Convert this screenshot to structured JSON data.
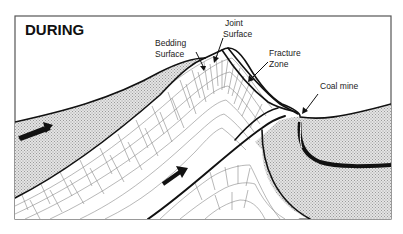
{
  "diagram": {
    "title": "DURING",
    "labels": {
      "bedding_surface_line1": "Bedding",
      "bedding_surface_line2": "Surface",
      "joint_surface_line1": "Joint",
      "joint_surface_line2": "Surface",
      "fracture_zone_line1": "Fracture",
      "fracture_zone_line2": "Zone",
      "coal_mine": "Coal mine"
    },
    "colors": {
      "frame": "#555555",
      "stroke": "#111111",
      "shaded_fill": "#d6d6d6",
      "block_lines": "#888888"
    }
  }
}
